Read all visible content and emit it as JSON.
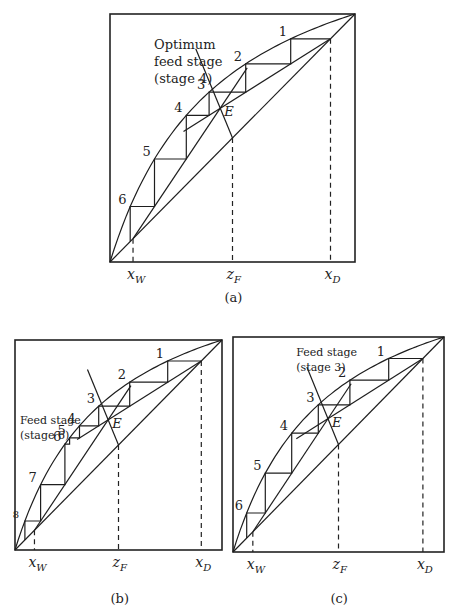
{
  "chart_data": [
    {
      "type": "line",
      "panel": "(a)",
      "title": "",
      "annotation": [
        "Optimum",
        "feed stage",
        "(stage 4)"
      ],
      "box": [
        110,
        14,
        355,
        262
      ],
      "x_labels": [
        {
          "text": "x",
          "sub": "W",
          "x": 0.094
        },
        {
          "text": "z",
          "sub": "F",
          "x": 0.5
        },
        {
          "text": "x",
          "sub": "D",
          "x": 0.9
        }
      ],
      "xW": 0.094,
      "zF": 0.5,
      "xD": 0.9,
      "equilibrium_curve": [
        [
          0,
          0
        ],
        [
          0.05,
          0.18
        ],
        [
          0.1,
          0.32
        ],
        [
          0.2,
          0.5
        ],
        [
          0.3,
          0.62
        ],
        [
          0.4,
          0.71
        ],
        [
          0.5,
          0.78
        ],
        [
          0.6,
          0.84
        ],
        [
          0.7,
          0.89
        ],
        [
          0.8,
          0.935
        ],
        [
          0.9,
          0.97
        ],
        [
          1,
          1
        ]
      ],
      "diagonal": [
        [
          0,
          0
        ],
        [
          1,
          1
        ]
      ],
      "rectifying_line": [
        [
          0.9,
          0.9
        ],
        [
          0.3,
          0.56
        ]
      ],
      "stripping_line": [
        [
          0.094,
          0.094
        ],
        [
          0.57,
          0.69
        ]
      ],
      "q_line": [
        [
          0.5,
          0.5
        ],
        [
          0.33,
          0.74
        ]
      ],
      "intersection_label": "E",
      "intersection": [
        0.45,
        0.62
      ],
      "stages": [
        {
          "n": "1",
          "x": 0.79,
          "y": 0.9
        },
        {
          "n": "2",
          "x": 0.62,
          "y": 0.84
        },
        {
          "n": "3",
          "x": 0.47,
          "y": 0.76
        },
        {
          "n": "4",
          "x": 0.33,
          "y": 0.66
        },
        {
          "n": "5",
          "x": 0.22,
          "y": 0.55
        },
        {
          "n": "6",
          "x": 0.14,
          "y": 0.39
        },
        {
          "n": "7",
          "x": 0.07,
          "y": 0.26
        }
      ],
      "caption": "(a)"
    },
    {
      "type": "line",
      "panel": "(b)",
      "annotation": [
        "Feed stage",
        "(stage 6)"
      ],
      "box": [
        15,
        340,
        222,
        550
      ],
      "x_labels": [
        {
          "text": "x",
          "sub": "W",
          "x": 0.094
        },
        {
          "text": "z",
          "sub": "F",
          "x": 0.5
        },
        {
          "text": "x",
          "sub": "D",
          "x": 0.9
        }
      ],
      "xW": 0.094,
      "zF": 0.5,
      "xD": 0.9,
      "intersection_label": "E",
      "stages": [
        {
          "n": "1",
          "x": 0.8,
          "y": 0.9
        },
        {
          "n": "2",
          "x": 0.66,
          "y": 0.85
        },
        {
          "n": "3",
          "x": 0.53,
          "y": 0.78
        },
        {
          "n": "4",
          "x": 0.4,
          "y": 0.7
        },
        {
          "n": "5",
          "x": 0.3,
          "y": 0.6
        },
        {
          "n": "6",
          "x": 0.24,
          "y": 0.53
        },
        {
          "n": "7",
          "x": 0.11,
          "y": 0.33
        },
        {
          "n": "8",
          "x": 0.04,
          "y": 0.17
        }
      ],
      "caption": "(b)"
    },
    {
      "type": "line",
      "panel": "(c)",
      "annotation": [
        "Feed stage",
        "(stage 3)"
      ],
      "box": [
        233,
        337,
        444,
        552
      ],
      "x_labels": [
        {
          "text": "x",
          "sub": "W",
          "x": 0.094
        },
        {
          "text": "z",
          "sub": "F",
          "x": 0.5
        },
        {
          "text": "x",
          "sub": "D",
          "x": 0.9
        }
      ],
      "xW": 0.094,
      "zF": 0.5,
      "xD": 0.9,
      "intersection_label": "E",
      "stages": [
        {
          "n": "1",
          "x": 0.8,
          "y": 0.9
        },
        {
          "n": "2",
          "x": 0.65,
          "y": 0.85
        },
        {
          "n": "3",
          "x": 0.52,
          "y": 0.78
        },
        {
          "n": "4",
          "x": 0.46,
          "y": 0.74
        },
        {
          "n": "5",
          "x": 0.38,
          "y": 0.66
        },
        {
          "n": "6",
          "x": 0.24,
          "y": 0.52
        },
        {
          "n": "7",
          "x": 0.11,
          "y": 0.34
        },
        {
          "n": "8",
          "x": 0.04,
          "y": 0.18
        }
      ],
      "caption": "(c)"
    }
  ]
}
